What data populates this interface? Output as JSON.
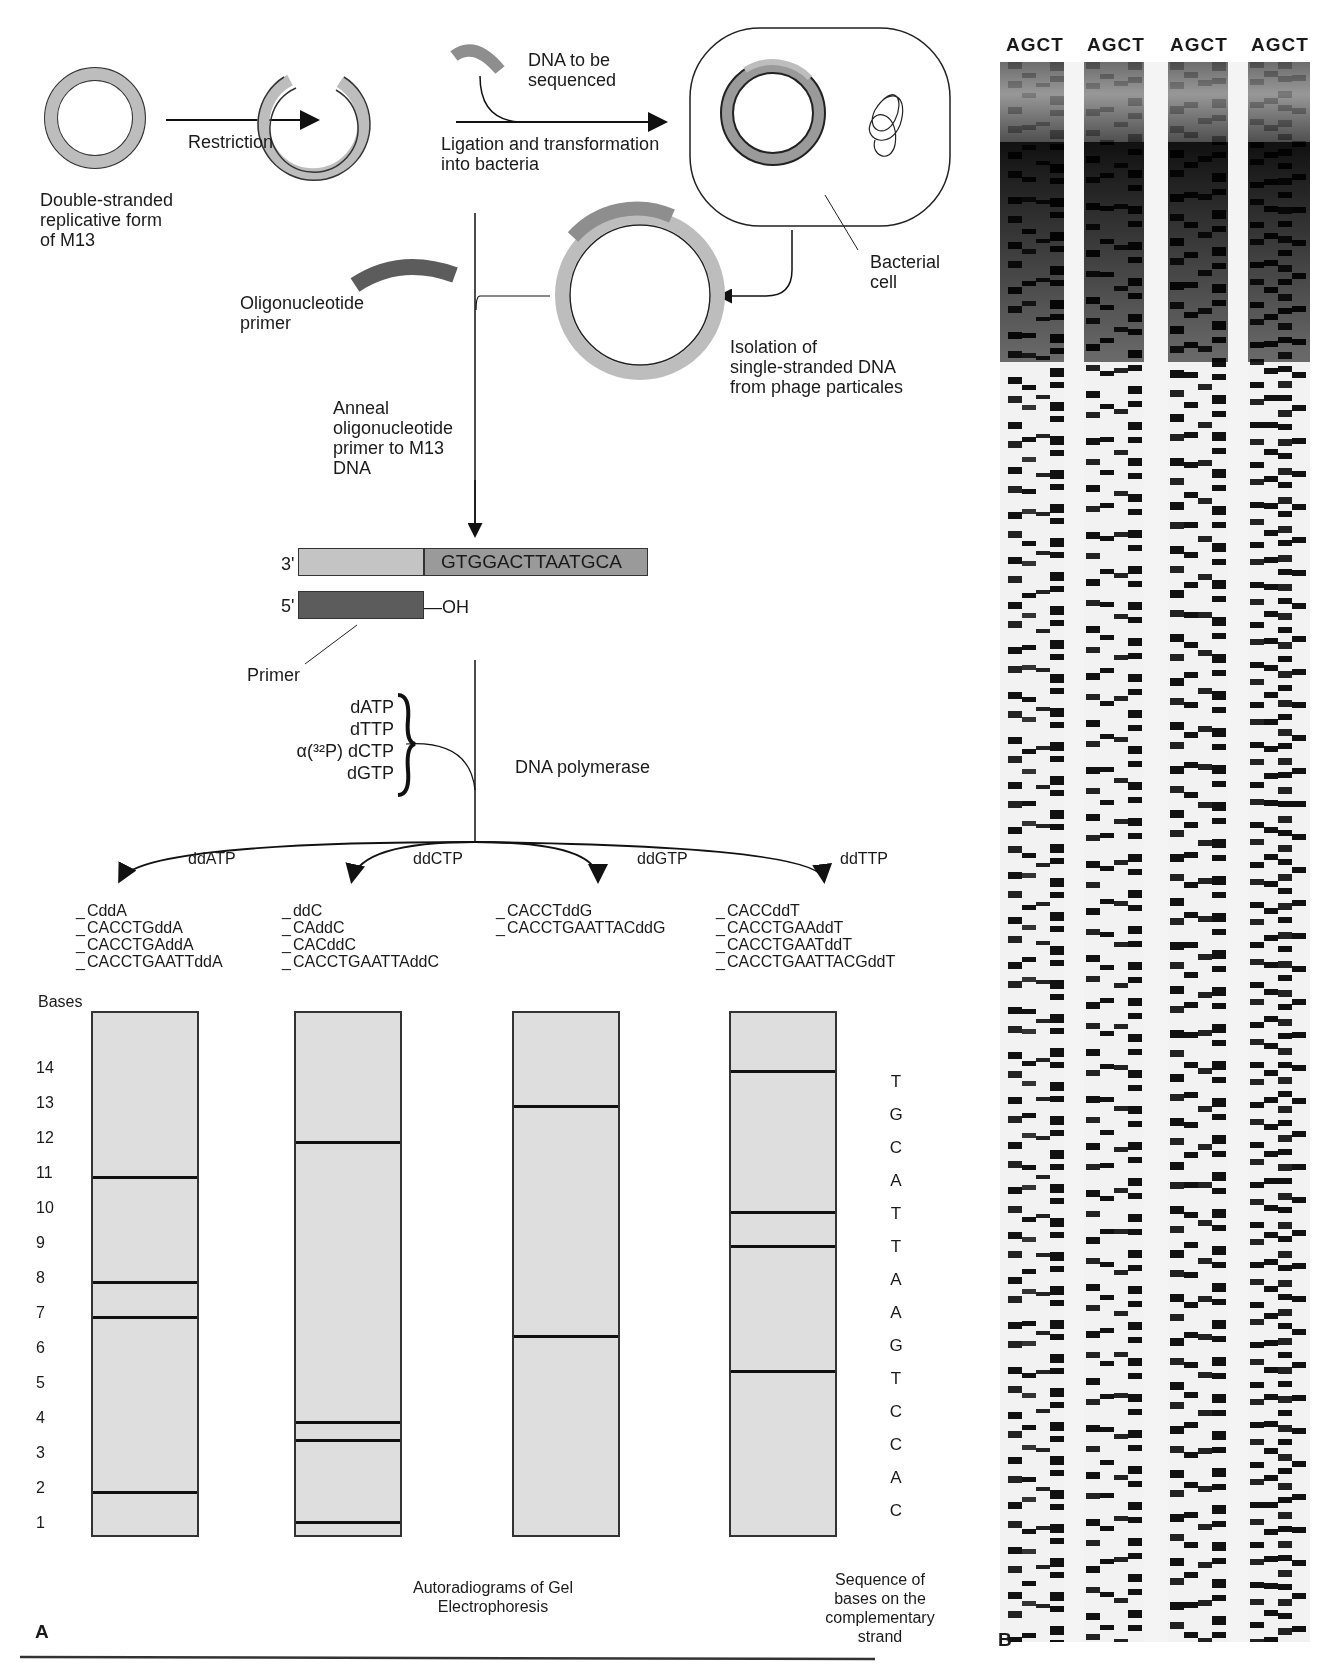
{
  "figure": {
    "title_steps": {
      "double_stranded_label": "Double-stranded\nreplicative form\nof M13",
      "restriction_label": "Restriction",
      "dna_to_be_sequenced_label": "DNA to be\nsequenced",
      "ligation_label": "Ligation and transformation\ninto bacteria",
      "bacterial_cell_label": "Bacterial\ncell",
      "isolation_label": "Isolation of\nsingle-stranded DNA\nfrom phage particales",
      "oligo_primer_label": "Oligonucleotide\nprimer",
      "anneal_label": "Anneal\noligonucleotide\nprimer to M13\nDNA"
    },
    "duplex": {
      "three_prime": "3'",
      "five_prime": "5'",
      "template_sequence": "GTGGACTTAATGCA",
      "oh_label": "—OH",
      "primer_label": "Primer"
    },
    "reaction": {
      "dntps": [
        "dATP",
        "dTTP",
        "α(³²P) dCTP",
        "dGTP"
      ],
      "enzyme_label": "DNA polymerase"
    },
    "terminators": [
      {
        "label": "ddATP",
        "fragments": [
          "CddA",
          "CACCTGddA",
          "CACCTGAddA",
          "CACCTGAATTddA"
        ]
      },
      {
        "label": "ddCTP",
        "fragments": [
          "ddC",
          "CAddC",
          "CACddC",
          "CACCTGAATTAddC"
        ]
      },
      {
        "label": "ddGTP",
        "fragments": [
          "CACCTddG",
          "CACCTGAATTACddG"
        ]
      },
      {
        "label": "ddTTP",
        "fragments": [
          "CACCddT",
          "CACCTGAAddT",
          "CACCTGAATddT",
          "CACCTGAATTACGddT"
        ]
      }
    ],
    "gel_a": {
      "axis_title": "Bases",
      "axis_ticks": [
        "14",
        "13",
        "12",
        "11",
        "10",
        "9",
        "8",
        "7",
        "6",
        "5",
        "4",
        "3",
        "2",
        "1"
      ],
      "lanes": [
        {
          "name": "A",
          "bands": [
            11,
            8,
            7,
            2
          ]
        },
        {
          "name": "C",
          "bands": [
            12,
            4,
            3.5,
            1
          ]
        },
        {
          "name": "G",
          "bands": [
            13,
            6
          ]
        },
        {
          "name": "T",
          "bands": [
            14,
            10,
            9,
            5.5
          ]
        }
      ],
      "complementary_sequence": [
        "T",
        "G",
        "C",
        "A",
        "T",
        "T",
        "A",
        "A",
        "G",
        "T",
        "C",
        "C",
        "A",
        "C"
      ],
      "caption_center": "Autoradiograms of Gel\nElectrophoresis",
      "caption_right": "Sequence of\nbases on the\ncomplementary\nstrand",
      "panel_letter": "A"
    },
    "gel_b": {
      "lane_headers": [
        "AGCT",
        "AGCT",
        "AGCT",
        "AGCT"
      ],
      "panel_letter": "B"
    },
    "colors": {
      "strand_light": "#bdbdbd",
      "strand_mid": "#8e8e8e",
      "strand_dark": "#5c5c5c",
      "gel_background": "#dedede",
      "band": "#111111"
    }
  }
}
